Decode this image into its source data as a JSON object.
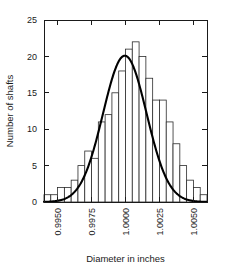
{
  "chart_data": {
    "type": "bar",
    "title": "",
    "xlabel": "Diameter in inches",
    "ylabel": "Number of shafts",
    "xlim": [
      0.994,
      1.006
    ],
    "ylim": [
      0,
      25
    ],
    "grid": false,
    "legend": null,
    "bin_width": 0.0005,
    "x_tick_labels": [
      "0.9950",
      "0.9975",
      "1.0000",
      "1.0025",
      "1.0050"
    ],
    "x_tick_values": [
      0.995,
      0.9975,
      1.0,
      1.0025,
      1.005
    ],
    "y_tick_labels": [
      "0",
      "5",
      "10",
      "15",
      "20",
      "25"
    ],
    "y_tick_values": [
      0,
      5,
      10,
      15,
      20,
      25
    ],
    "bin_starts": [
      0.994,
      0.9945,
      0.995,
      0.9955,
      0.996,
      0.9965,
      0.997,
      0.9975,
      0.998,
      0.9985,
      0.999,
      0.9995,
      1.0,
      1.0005,
      1.001,
      1.0015,
      1.002,
      1.0025,
      1.003,
      1.0035,
      1.004,
      1.0045,
      1.005,
      1.0055
    ],
    "categories": [
      "0.99400",
      "0.99450",
      "0.99500",
      "0.99550",
      "0.99600",
      "0.99650",
      "0.99700",
      "0.99750",
      "0.99800",
      "0.99850",
      "0.99900",
      "0.99950",
      "1.00000",
      "1.00050",
      "1.00100",
      "1.00150",
      "1.00200",
      "1.00250",
      "1.00300",
      "1.00350",
      "1.00400",
      "1.00450",
      "1.00500",
      "1.00550"
    ],
    "values": [
      1,
      1,
      2,
      2,
      3,
      5,
      7,
      6,
      11,
      12,
      15,
      18,
      21,
      22,
      20,
      17,
      14,
      14,
      11,
      8,
      5,
      3,
      2,
      1
    ],
    "series": [
      {
        "name": "Number of shafts",
        "values": [
          1,
          1,
          2,
          2,
          3,
          5,
          7,
          6,
          11,
          12,
          15,
          18,
          21,
          22,
          20,
          17,
          14,
          14,
          11,
          8,
          5,
          3,
          2,
          1
        ]
      }
    ],
    "overlay_curve": {
      "name": "normal-distribution-curve",
      "type": "line",
      "mean": 0.99995,
      "peak_value": 20.1,
      "std_dev": 0.0016
    }
  },
  "axes": {
    "x_axis_title": "Diameter in inches",
    "y_axis_title": "Number of shafts"
  }
}
